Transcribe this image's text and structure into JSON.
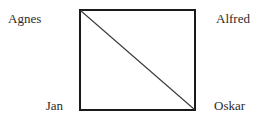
{
  "figure": {
    "background_color": "#ffffff",
    "shape": {
      "type": "square",
      "border_color": "#1a1a1a",
      "diagonal_color": "#3a3a3a",
      "diagonal_from": "top-left",
      "diagonal_to": "bottom-right"
    },
    "labels": {
      "top_left": "Agnes",
      "top_right": "Alfred",
      "bottom_left": "Jan",
      "bottom_right": "Oskar"
    }
  }
}
